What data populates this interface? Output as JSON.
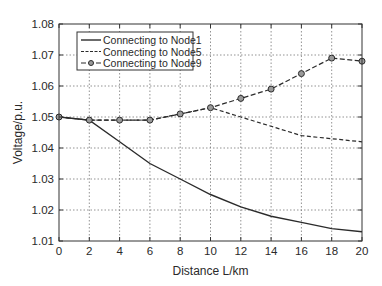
{
  "chart_data": {
    "type": "line",
    "title": "",
    "xlabel": "Distance L/km",
    "ylabel": "Voltage/p.u.",
    "xlim": [
      0,
      20
    ],
    "ylim": [
      1.01,
      1.08
    ],
    "xticks": [
      0,
      2,
      4,
      6,
      8,
      10,
      12,
      14,
      16,
      18,
      20
    ],
    "yticks": [
      1.01,
      1.02,
      1.03,
      1.04,
      1.05,
      1.06,
      1.07,
      1.08
    ],
    "xtick_labels": [
      "0",
      "2",
      "4",
      "6",
      "8",
      "10",
      "12",
      "14",
      "16",
      "18",
      "20"
    ],
    "ytick_labels": [
      "1.01",
      "1.02",
      "1.03",
      "1.04",
      "1.05",
      "1.06",
      "1.07",
      "1.08"
    ],
    "grid": true,
    "legend_position": "upper left",
    "x": [
      0,
      2,
      4,
      6,
      8,
      10,
      12,
      14,
      16,
      18,
      20
    ],
    "series": [
      {
        "name": "Connecting to Node1",
        "style": "solid",
        "marker": "none",
        "values": [
          1.05,
          1.049,
          1.042,
          1.035,
          1.03,
          1.025,
          1.021,
          1.018,
          1.016,
          1.014,
          1.013
        ]
      },
      {
        "name": "Connecting to Node5",
        "style": "dashed",
        "marker": "none",
        "values": [
          1.05,
          1.049,
          1.049,
          1.049,
          1.051,
          1.053,
          1.05,
          1.047,
          1.044,
          1.043,
          1.042
        ]
      },
      {
        "name": "Connecting to Node9",
        "style": "dash-dot",
        "marker": "circle",
        "values": [
          1.05,
          1.049,
          1.049,
          1.049,
          1.051,
          1.053,
          1.056,
          1.059,
          1.064,
          1.069,
          1.068
        ]
      }
    ]
  }
}
